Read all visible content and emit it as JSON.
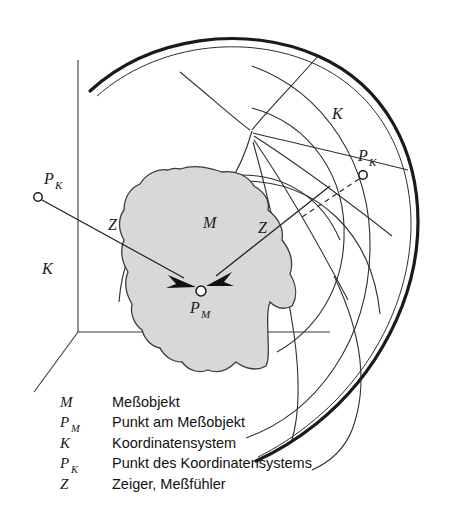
{
  "figure": {
    "background_color": "#ffffff",
    "object_fill_color": "#d8d8d8",
    "line_color": "#2e2e2e"
  },
  "diagram_labels": {
    "object_M": "M",
    "point_PM_base": "P",
    "point_PM_sub": "M",
    "cartesian_K": "K",
    "cartesian_PK_base": "P",
    "cartesian_PK_sub": "K",
    "spherical_K": "K",
    "spherical_PK_base": "P",
    "spherical_PK_sub": "K",
    "pointer_left_Z": "Z",
    "pointer_right_Z": "Z"
  },
  "legend": {
    "rows": [
      {
        "symbol": "M",
        "subscript": "",
        "description": "Meßobjekt"
      },
      {
        "symbol": "P",
        "subscript": "M",
        "description": "Punkt am Meßobjekt"
      },
      {
        "symbol": "K",
        "subscript": "",
        "description": "Koordinatensystem"
      },
      {
        "symbol": "P",
        "subscript": "K",
        "description": "Punkt des Koordinatensystems"
      },
      {
        "symbol": "Z",
        "subscript": "",
        "description": "Zeiger, Meßfühler"
      }
    ]
  }
}
